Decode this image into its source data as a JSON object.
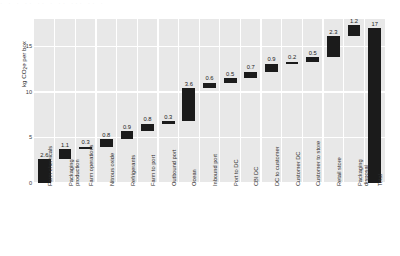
{
  "figure": {
    "top_artifact_text": "· · ·  ·· ·· ·  ·· ···  ·· ·",
    "ylabel": "kg CO",
    "ylabel_sub": "2",
    "ylabel_tail": "e per box"
  },
  "chart_data": {
    "type": "bar",
    "subtype": "waterfall",
    "title": "",
    "xlabel": "",
    "ylabel": "kg CO2e per box",
    "ylim": [
      0,
      18
    ],
    "yticks": [
      0,
      5,
      10,
      15
    ],
    "ytick_labels": [
      "0",
      "5",
      "10",
      "15"
    ],
    "grid": true,
    "legend": "none",
    "categories": [
      "Farm chemicals",
      "Packaging production",
      "Farm operations",
      "Nitrous oxide",
      "Refrigerants",
      "Farm to port",
      "Outbound port",
      "Ocean",
      "Inbound port",
      "Port to DC",
      "CBI DC",
      "DC to customer",
      "Customer DC",
      "Customer to store",
      "Retail store",
      "Packaging disposal",
      "Total"
    ],
    "values": [
      2.6,
      1.1,
      0.3,
      0.8,
      0.9,
      0.8,
      0.3,
      3.6,
      0.6,
      0.5,
      0.7,
      0.9,
      0.2,
      0.5,
      2.3,
      1.2,
      17
    ],
    "value_labels": [
      "2.6",
      "1.1",
      "0.3",
      "0.8",
      "0.9",
      "0.8",
      "0.3",
      "3.6",
      "0.6",
      "0.5",
      "0.7",
      "0.9",
      "0.2",
      "0.5",
      "2.3",
      "1.2",
      "17"
    ],
    "cumulative_bottom": [
      0,
      2.6,
      3.7,
      4.0,
      4.8,
      5.7,
      6.5,
      6.8,
      10.4,
      11.0,
      11.5,
      12.2,
      13.1,
      13.3,
      13.8,
      16.1,
      0
    ],
    "cumulative_top": [
      2.6,
      3.7,
      4.0,
      4.8,
      5.7,
      6.5,
      6.8,
      10.4,
      11.0,
      11.5,
      12.2,
      13.1,
      13.3,
      13.8,
      16.1,
      17.3,
      17
    ],
    "is_total": [
      false,
      false,
      false,
      false,
      false,
      false,
      false,
      false,
      false,
      false,
      false,
      false,
      false,
      false,
      false,
      false,
      true
    ],
    "bar_color": "#1b1b1b",
    "plot_background": "#e8e8e8",
    "grid_color": "#ffffff"
  }
}
